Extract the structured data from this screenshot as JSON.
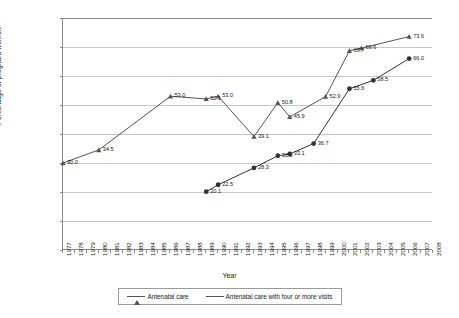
{
  "chart_data": {
    "type": "line",
    "title": "",
    "xlabel": "Year",
    "ylabel": "Percentage of pregnant women",
    "ylim": [
      0,
      80
    ],
    "ytick_step": 10,
    "yticks": [
      0,
      10,
      20,
      30,
      40,
      50,
      60,
      70,
      80
    ],
    "xlim": [
      1977,
      2008
    ],
    "xticks": [
      1977,
      1978,
      1979,
      1980,
      1981,
      1982,
      1983,
      1984,
      1985,
      1986,
      1987,
      1988,
      1989,
      1990,
      1991,
      1992,
      1993,
      1994,
      1995,
      1996,
      1997,
      1998,
      1999,
      2000,
      2001,
      2002,
      2003,
      2004,
      2005,
      2006,
      2007,
      2008
    ],
    "grid": "horizontal",
    "legend_position": "bottom",
    "series": [
      {
        "name": "Antenatal care",
        "marker": "triangle",
        "color": "#555555",
        "points": [
          {
            "x": 1977,
            "y": 30.0,
            "label": "30.0"
          },
          {
            "x": 1980,
            "y": 34.5,
            "label": "34.5"
          },
          {
            "x": 1986,
            "y": 53.0,
            "label": "53.0"
          },
          {
            "x": 1989,
            "y": 52.1,
            "label": "52.1"
          },
          {
            "x": 1990,
            "y": 53.0,
            "label": "53.0"
          },
          {
            "x": 1993,
            "y": 39.1,
            "label": "39.1"
          },
          {
            "x": 1995,
            "y": 50.8,
            "label": "50.8"
          },
          {
            "x": 1996,
            "y": 45.9,
            "label": "45.9"
          },
          {
            "x": 1999,
            "y": 52.9,
            "label": "52.9"
          },
          {
            "x": 2001,
            "y": 68.7,
            "label": "68.7"
          },
          {
            "x": 2002,
            "y": 69.6,
            "label": "69.6"
          },
          {
            "x": 2006,
            "y": 73.6,
            "label": "73.6"
          }
        ]
      },
      {
        "name": "Antenatal care with four or more visits",
        "marker": "circle",
        "color": "#333333",
        "points": [
          {
            "x": 1989,
            "y": 20.1,
            "label": "20.1"
          },
          {
            "x": 1990,
            "y": 22.5,
            "label": "22.5"
          },
          {
            "x": 1993,
            "y": 28.3,
            "label": "28.3"
          },
          {
            "x": 1995,
            "y": 32.5,
            "label": "32.5"
          },
          {
            "x": 1996,
            "y": 33.1,
            "label": "33.1"
          },
          {
            "x": 1998,
            "y": 36.7,
            "label": "36.7"
          },
          {
            "x": 2001,
            "y": 55.6,
            "label": "55.6"
          },
          {
            "x": 2003,
            "y": 58.5,
            "label": "58.5"
          },
          {
            "x": 2006,
            "y": 66.0,
            "label": "66.0"
          }
        ]
      }
    ]
  },
  "legend": {
    "entries": [
      {
        "label": "Antenatal care"
      },
      {
        "label": "Antenatal care with four or more visits"
      }
    ]
  },
  "axes": {
    "x_title": "Year",
    "y_title": "Percentage of pregnant women"
  }
}
